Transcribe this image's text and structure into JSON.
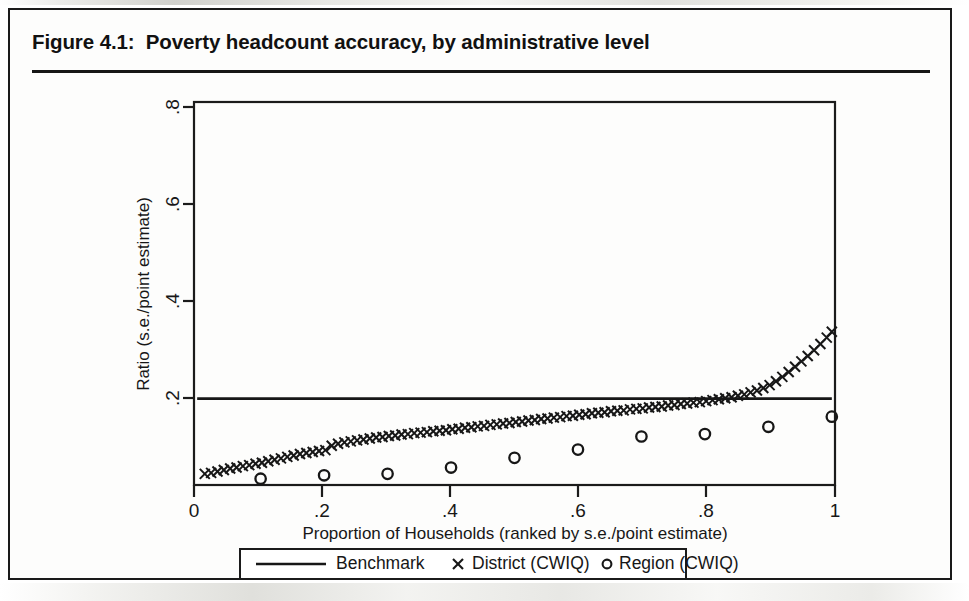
{
  "figure": {
    "title": "Figure 4.1:  Poverty headcount accuracy, by administrative level"
  },
  "chart_data": {
    "type": "scatter",
    "title": "Figure 4.1:  Poverty headcount accuracy, by administrative level",
    "xlabel": "Proportion of Households (ranked by s.e./point estimate)",
    "ylabel": "Ratio (s.e./point estimate)",
    "xlim": [
      -0.005,
      1.005
    ],
    "ylim": [
      0.022,
      0.812
    ],
    "xticks": [
      0,
      0.2,
      0.4,
      0.6,
      0.8,
      1
    ],
    "xticklabels": [
      "0",
      ".2",
      ".4",
      ".6",
      ".8",
      "1"
    ],
    "yticks": [
      0.2,
      0.4,
      0.6,
      0.8
    ],
    "yticklabels": [
      ".2",
      ".4",
      ".6",
      ".8"
    ],
    "grid": false,
    "legend_position": "below-axis",
    "series": [
      {
        "name": "Benchmark",
        "marker": "line",
        "type": "hline",
        "value": 0.2,
        "x": [
          0,
          1
        ],
        "values": [
          0.2,
          0.2
        ]
      },
      {
        "name": "District (CWIQ)",
        "marker": "x",
        "type": "scatter",
        "x": [
          0.012,
          0.022,
          0.032,
          0.042,
          0.052,
          0.062,
          0.072,
          0.082,
          0.092,
          0.102,
          0.112,
          0.122,
          0.132,
          0.142,
          0.152,
          0.162,
          0.172,
          0.182,
          0.192,
          0.202,
          0.212,
          0.222,
          0.232,
          0.242,
          0.252,
          0.262,
          0.272,
          0.282,
          0.292,
          0.302,
          0.312,
          0.322,
          0.332,
          0.342,
          0.352,
          0.362,
          0.372,
          0.382,
          0.392,
          0.402,
          0.412,
          0.422,
          0.432,
          0.442,
          0.452,
          0.462,
          0.472,
          0.482,
          0.492,
          0.502,
          0.512,
          0.522,
          0.532,
          0.542,
          0.552,
          0.562,
          0.572,
          0.582,
          0.592,
          0.602,
          0.612,
          0.622,
          0.632,
          0.642,
          0.652,
          0.662,
          0.672,
          0.682,
          0.692,
          0.702,
          0.712,
          0.722,
          0.732,
          0.742,
          0.752,
          0.762,
          0.772,
          0.782,
          0.792,
          0.802,
          0.812,
          0.822,
          0.832,
          0.842,
          0.852,
          0.862,
          0.872,
          0.882,
          0.892,
          0.902,
          0.912,
          0.922,
          0.932,
          0.942,
          0.952,
          0.962,
          0.972,
          0.982,
          0.992,
          1.0
        ],
        "values": [
          0.045,
          0.047,
          0.05,
          0.053,
          0.056,
          0.058,
          0.061,
          0.063,
          0.066,
          0.068,
          0.071,
          0.074,
          0.077,
          0.08,
          0.083,
          0.086,
          0.088,
          0.09,
          0.092,
          0.094,
          0.103,
          0.107,
          0.11,
          0.112,
          0.114,
          0.116,
          0.118,
          0.12,
          0.121,
          0.123,
          0.124,
          0.126,
          0.127,
          0.129,
          0.13,
          0.131,
          0.133,
          0.134,
          0.135,
          0.137,
          0.138,
          0.14,
          0.141,
          0.143,
          0.144,
          0.146,
          0.147,
          0.149,
          0.15,
          0.152,
          0.153,
          0.155,
          0.156,
          0.158,
          0.159,
          0.161,
          0.162,
          0.164,
          0.165,
          0.167,
          0.168,
          0.17,
          0.171,
          0.172,
          0.174,
          0.175,
          0.176,
          0.178,
          0.179,
          0.18,
          0.182,
          0.183,
          0.184,
          0.186,
          0.187,
          0.189,
          0.19,
          0.192,
          0.193,
          0.195,
          0.197,
          0.199,
          0.201,
          0.203,
          0.206,
          0.209,
          0.213,
          0.217,
          0.222,
          0.228,
          0.236,
          0.245,
          0.255,
          0.266,
          0.277,
          0.288,
          0.3,
          0.313,
          0.326,
          0.338
        ]
      },
      {
        "name": "Region (CWIQ)",
        "marker": "o",
        "type": "scatter",
        "x": [
          0.1,
          0.2,
          0.3,
          0.4,
          0.5,
          0.6,
          0.7,
          0.8,
          0.9,
          1.0
        ],
        "values": [
          0.035,
          0.042,
          0.045,
          0.058,
          0.078,
          0.095,
          0.122,
          0.127,
          0.142,
          0.163
        ]
      }
    ],
    "legend": [
      "Benchmark",
      "District (CWIQ)",
      "Region (CWIQ)"
    ]
  },
  "legend": {
    "benchmark_label": "Benchmark",
    "district_label": "District (CWIQ)",
    "region_label": "Region (CWIQ)"
  },
  "axes": {
    "x_title": "Proportion of Households (ranked by s.e./point estimate)",
    "y_title": "Ratio (s.e./point estimate)",
    "x_tick_0": "0",
    "x_tick_1": ".2",
    "x_tick_2": ".4",
    "x_tick_3": ".6",
    "x_tick_4": ".8",
    "x_tick_5": "1",
    "y_tick_0": ".2",
    "y_tick_1": ".4",
    "y_tick_2": ".6",
    "y_tick_3": ".8"
  },
  "colors": {
    "ink": "#171717",
    "frame": "#1a1a1a",
    "paper": "#fdfdfc"
  }
}
